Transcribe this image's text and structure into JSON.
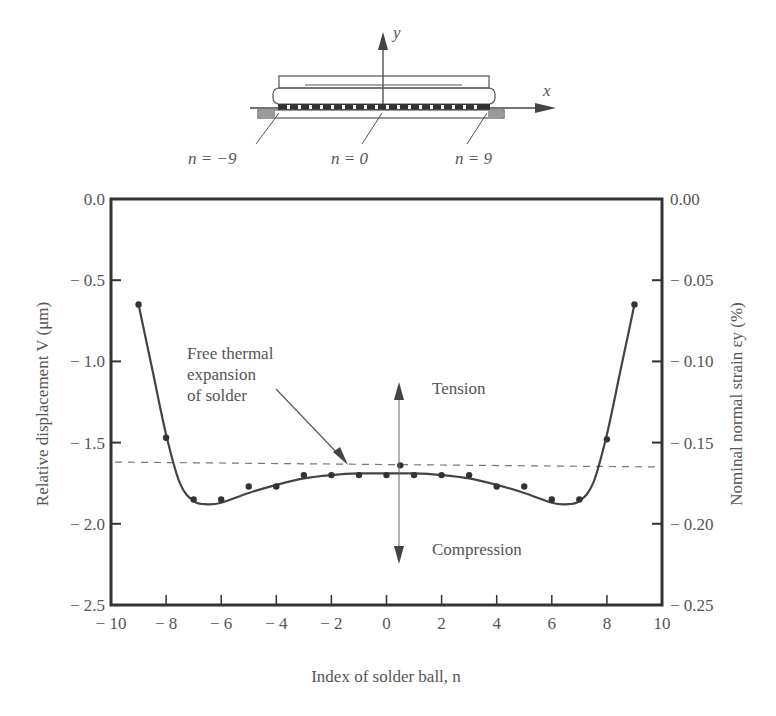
{
  "diagram": {
    "y_axis_label": "y",
    "x_axis_label": "x",
    "labels": [
      {
        "text": "n = −9",
        "x": 188,
        "y": 164
      },
      {
        "text": "n = 0",
        "x": 331,
        "y": 164
      },
      {
        "text": "n = 9",
        "x": 455,
        "y": 164
      }
    ]
  },
  "annotations": {
    "free_thermal": [
      "Free thermal",
      "expansion",
      "of solder"
    ],
    "tension": "Tension",
    "compression": "Compression"
  },
  "chart_data": {
    "type": "line",
    "title": "",
    "xlabel": "Index of solder ball, n",
    "ylabel": "Relative displacement V  (μm)",
    "y2label": "Nominal normal strain εy  (%)",
    "xlim": [
      -10,
      10
    ],
    "ylim": [
      -2.5,
      0.0
    ],
    "y2lim": [
      -0.25,
      0.0
    ],
    "xticks": [
      -10,
      -8,
      -6,
      -4,
      -2,
      0,
      2,
      4,
      6,
      8,
      10
    ],
    "xtick_labels": [
      "− 10",
      "− 8",
      "− 6",
      "− 4",
      "− 2",
      "0",
      "2",
      "4",
      "6",
      "8",
      "10"
    ],
    "yticks": [
      0.0,
      -0.5,
      -1.0,
      -1.5,
      -2.0,
      -2.5
    ],
    "ytick_labels": [
      "0.0",
      "− 0.5",
      "− 1.0",
      "− 1.5",
      "− 2.0",
      "− 2.5"
    ],
    "y2ticks": [
      0.0,
      -0.05,
      -0.1,
      -0.15,
      -0.2,
      -0.25
    ],
    "y2tick_labels": [
      "0.00",
      "− 0.05",
      "− 0.10",
      "− 0.15",
      "− 0.20",
      "− 0.25"
    ],
    "grid": false,
    "series": [
      {
        "name": "Measured relative displacement",
        "style": "markers",
        "x": [
          -9,
          -8,
          -7,
          -6,
          -5,
          -4,
          -3,
          -2,
          -1,
          0,
          0.5,
          1,
          2,
          3,
          4,
          5,
          6,
          7,
          8,
          9
        ],
        "values": [
          -0.65,
          -1.47,
          -1.85,
          -1.85,
          -1.77,
          -1.77,
          -1.7,
          -1.7,
          -1.7,
          -1.7,
          -1.64,
          -1.7,
          -1.7,
          -1.7,
          -1.77,
          -1.77,
          -1.85,
          -1.85,
          -1.48,
          -0.65
        ]
      },
      {
        "name": "Fitted curve",
        "style": "line",
        "x": [
          -9,
          -8.5,
          -8,
          -7.5,
          -7,
          -6.5,
          -6,
          -5,
          -4,
          -3,
          -2,
          -1,
          0,
          1,
          2,
          3,
          4,
          5,
          6,
          6.5,
          7,
          7.5,
          8,
          8.5,
          9
        ],
        "values": [
          -0.65,
          -1.05,
          -1.45,
          -1.75,
          -1.86,
          -1.88,
          -1.87,
          -1.81,
          -1.76,
          -1.72,
          -1.7,
          -1.69,
          -1.69,
          -1.69,
          -1.7,
          -1.72,
          -1.76,
          -1.81,
          -1.87,
          -1.88,
          -1.86,
          -1.75,
          -1.45,
          -1.05,
          -0.65
        ]
      },
      {
        "name": "Free thermal expansion of solder",
        "style": "dashed",
        "x": [
          -10,
          10
        ],
        "values": [
          -1.62,
          -1.65
        ]
      }
    ],
    "annotations": [
      {
        "text": "Free thermal expansion of solder",
        "arrow_to": [
          -1.2,
          -1.63
        ]
      },
      {
        "text": "Tension",
        "arrow": "up",
        "x": 0.5
      },
      {
        "text": "Compression",
        "arrow": "down",
        "x": 0.5
      }
    ]
  }
}
